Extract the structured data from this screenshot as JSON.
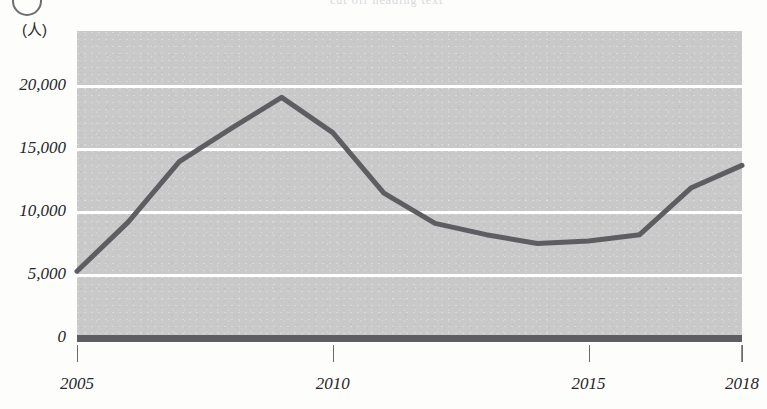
{
  "header": {
    "circle_marker": "circled-number-marker",
    "top_fragment": "cut off heading text"
  },
  "axis": {
    "unit_label": "(人)",
    "y_ticks": [
      "20,000",
      "15,000",
      "10,000",
      "5,000",
      "0"
    ],
    "x_ticks": [
      "2005",
      "2010",
      "2015",
      "2018"
    ]
  },
  "colors": {
    "plot_background": "#c9c9c9",
    "gridline": "#ffffff",
    "series_line": "#5e5e62",
    "baseline": "#5e5e62",
    "text": "#26262a"
  },
  "chart_data": {
    "type": "line",
    "title": "",
    "subtitle": "",
    "xlabel": "",
    "ylabel": "(人)",
    "x": [
      2005,
      2006,
      2007,
      2008,
      2009,
      2010,
      2011,
      2012,
      2013,
      2014,
      2015,
      2016,
      2017,
      2018
    ],
    "categories": [
      "2005",
      "2006",
      "2007",
      "2008",
      "2009",
      "2010",
      "2011",
      "2012",
      "2013",
      "2014",
      "2015",
      "2016",
      "2017",
      "2018"
    ],
    "series": [
      {
        "name": "人数",
        "values": [
          5300,
          9200,
          14000,
          16600,
          19100,
          16300,
          11500,
          9100,
          8200,
          7500,
          7700,
          8200,
          11900,
          13700
        ]
      }
    ],
    "values": [
      5300,
      9200,
      14000,
      16600,
      19100,
      16300,
      11500,
      9100,
      8200,
      7500,
      7700,
      8200,
      11900,
      13700
    ],
    "xlim": [
      2005,
      2018
    ],
    "ylim": [
      0,
      22000
    ],
    "y_tick_values": [
      20000,
      15000,
      10000,
      5000,
      0
    ],
    "x_tick_values": [
      2005,
      2010,
      2015,
      2018
    ],
    "grid": true,
    "grid_axis": "y",
    "legend": false,
    "legend_position": "none"
  }
}
